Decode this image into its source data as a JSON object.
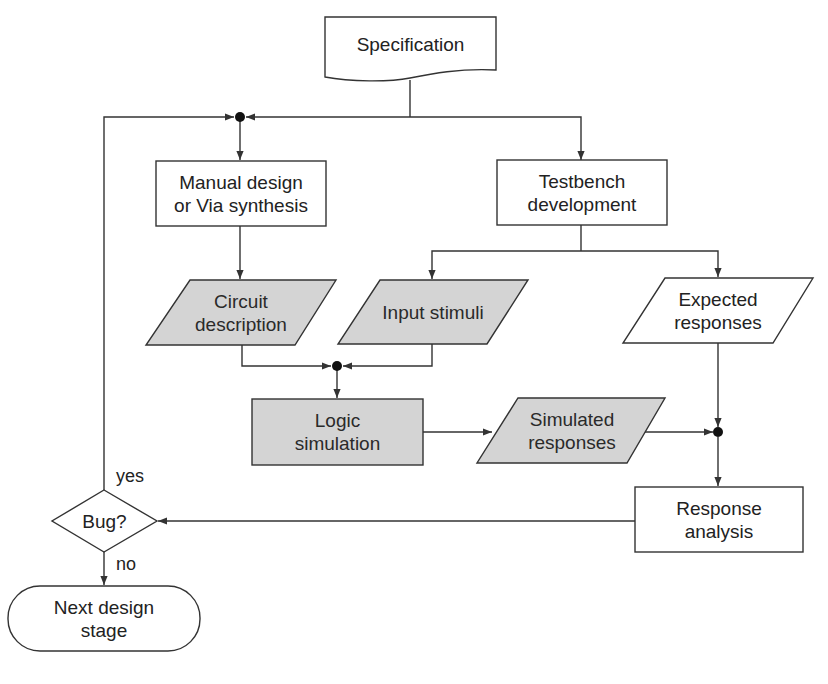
{
  "diagram": {
    "type": "flowchart",
    "nodes": {
      "specification": {
        "label": "Specification",
        "shape": "document"
      },
      "manual_design": {
        "label": "Manual design\nor Via synthesis",
        "shape": "process"
      },
      "testbench": {
        "label": "Testbench\ndevelopment",
        "shape": "process"
      },
      "circuit_description": {
        "label": "Circuit\ndescription",
        "shape": "data",
        "shaded": true
      },
      "input_stimuli": {
        "label": "Input stimuli",
        "shape": "data",
        "shaded": true
      },
      "expected_responses": {
        "label": "Expected\nresponses",
        "shape": "data",
        "shaded": false
      },
      "logic_simulation": {
        "label": "Logic\nsimulation",
        "shape": "process",
        "shaded": true
      },
      "simulated_responses": {
        "label": "Simulated\nresponses",
        "shape": "data",
        "shaded": true
      },
      "response_analysis": {
        "label": "Response\nanalysis",
        "shape": "process"
      },
      "bug_decision": {
        "label": "Bug?",
        "shape": "decision"
      },
      "next_stage": {
        "label": "Next design\nstage",
        "shape": "terminator"
      }
    },
    "edge_labels": {
      "yes": "yes",
      "no": "no"
    },
    "edges": [
      {
        "from": "specification",
        "to": "manual_design"
      },
      {
        "from": "specification",
        "to": "testbench"
      },
      {
        "from": "manual_design",
        "to": "circuit_description"
      },
      {
        "from": "testbench",
        "to": "input_stimuli"
      },
      {
        "from": "testbench",
        "to": "expected_responses"
      },
      {
        "from": "circuit_description",
        "to": "logic_simulation"
      },
      {
        "from": "input_stimuli",
        "to": "logic_simulation"
      },
      {
        "from": "logic_simulation",
        "to": "simulated_responses"
      },
      {
        "from": "simulated_responses",
        "to": "response_analysis"
      },
      {
        "from": "expected_responses",
        "to": "response_analysis"
      },
      {
        "from": "response_analysis",
        "to": "bug_decision"
      },
      {
        "from": "bug_decision",
        "to": "manual_design",
        "label": "yes"
      },
      {
        "from": "bug_decision",
        "to": "next_stage",
        "label": "no"
      }
    ],
    "colors": {
      "stroke": "#333333",
      "shaded_fill": "#d4d4d4",
      "plain_fill": "#ffffff"
    }
  }
}
